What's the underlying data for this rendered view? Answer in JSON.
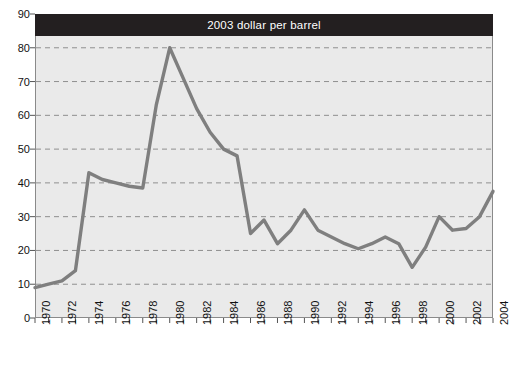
{
  "chart_data": {
    "type": "line",
    "title": "2003 dollar per barrel",
    "xlabel": "",
    "ylabel": "",
    "ylim": [
      0,
      90
    ],
    "xlim": [
      1970,
      2004
    ],
    "ytick_step": 10,
    "xtick_step": 1,
    "xlabel_step": 2,
    "grid": true,
    "legend": "none",
    "line_color": "#7f7f7f",
    "plot_background": "#eaeaea",
    "title_background": "#231f20",
    "title_color": "#ffffff",
    "grid_color": "#8f8f8f",
    "axis_color": "#8a8a8a",
    "yticks": [
      0,
      10,
      20,
      30,
      40,
      50,
      60,
      70,
      80,
      90
    ],
    "ytick_labels": [
      "0",
      "10",
      "20",
      "30",
      "40",
      "50",
      "60",
      "70",
      "80",
      "90"
    ],
    "xticks": [
      1970,
      1971,
      1972,
      1973,
      1974,
      1975,
      1976,
      1977,
      1978,
      1979,
      1980,
      1981,
      1982,
      1983,
      1984,
      1985,
      1986,
      1987,
      1988,
      1989,
      1990,
      1991,
      1992,
      1993,
      1994,
      1995,
      1996,
      1997,
      1998,
      1999,
      2000,
      2001,
      2002,
      2003,
      2004
    ],
    "xtick_labels": [
      "1970",
      "1972",
      "1974",
      "1976",
      "1978",
      "1980",
      "1982",
      "1984",
      "1986",
      "1988",
      "1990",
      "1992",
      "1994",
      "1996",
      "1998",
      "2000",
      "2002",
      "2004"
    ],
    "x": [
      1970,
      1971,
      1972,
      1973,
      1974,
      1975,
      1976,
      1977,
      1978,
      1979,
      1980,
      1981,
      1982,
      1983,
      1984,
      1985,
      1986,
      1987,
      1988,
      1989,
      1990,
      1991,
      1992,
      1993,
      1994,
      1995,
      1996,
      1997,
      1998,
      1999,
      2000,
      2001,
      2002,
      2003,
      2004
    ],
    "values": [
      9,
      10,
      11,
      14,
      43,
      41,
      40,
      39,
      38.5,
      63,
      80,
      71,
      62,
      55,
      50,
      48,
      25,
      29,
      22,
      26,
      32,
      26,
      24,
      22,
      20.5,
      22,
      24,
      22,
      15,
      21,
      30,
      26,
      26.5,
      30,
      37.5
    ]
  }
}
